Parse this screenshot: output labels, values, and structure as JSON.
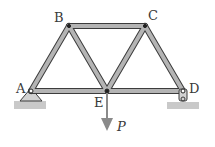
{
  "diagram": {
    "type": "truss",
    "joints": [
      {
        "id": "A",
        "label": "A",
        "x": 31,
        "y": 91
      },
      {
        "id": "B",
        "label": "B",
        "x": 69,
        "y": 26
      },
      {
        "id": "C",
        "label": "C",
        "x": 145,
        "y": 26
      },
      {
        "id": "E",
        "label": "E",
        "x": 107,
        "y": 91
      },
      {
        "id": "D",
        "label": "D",
        "x": 183,
        "y": 91
      }
    ],
    "members": [
      [
        "A",
        "B"
      ],
      [
        "B",
        "C"
      ],
      [
        "B",
        "E"
      ],
      [
        "C",
        "E"
      ],
      [
        "C",
        "D"
      ],
      [
        "A",
        "E"
      ],
      [
        "E",
        "D"
      ]
    ],
    "supports": [
      {
        "joint": "A",
        "type": "pin"
      },
      {
        "joint": "D",
        "type": "roller"
      }
    ],
    "load": {
      "joint": "E",
      "label": "P",
      "direction": "down"
    },
    "colors": {
      "member_fill": "#b4b4b4",
      "member_edge": "#3c3c3c",
      "ground": "#c9c9c9",
      "arrow": "#8a8a8a",
      "text": "#3a3a3a"
    }
  }
}
